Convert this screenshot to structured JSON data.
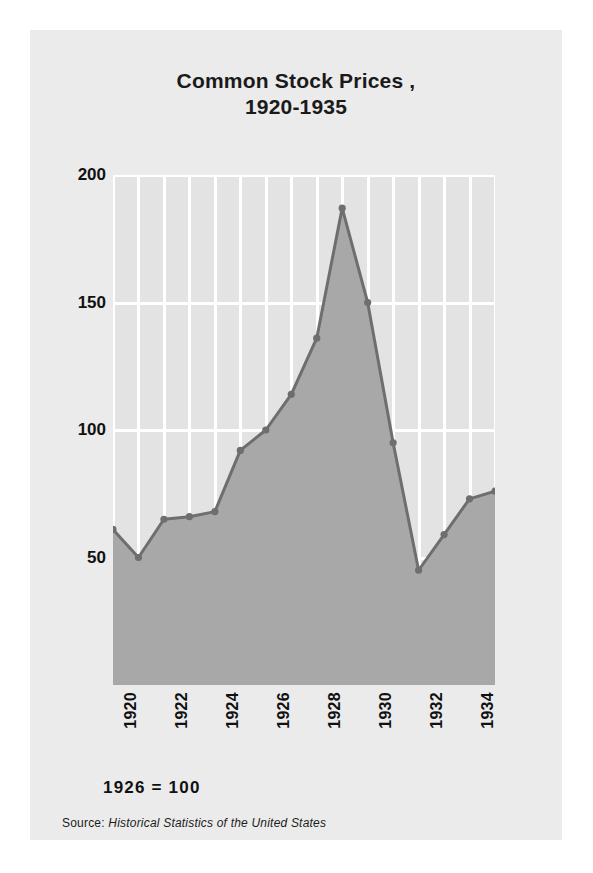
{
  "figure": {
    "title_line1": "Common Stock Prices ,",
    "title_line2": "1920-1935",
    "base_note": "1926 = 100",
    "source_label": "Source:",
    "source_title": "Historical Statistics of the United States"
  },
  "colors": {
    "card_background": "#ebebeb",
    "plot_background": "#e3e3e3",
    "gridline": "#ffffff",
    "area_fill": "#a8a8a8",
    "line": "#6e6e6e",
    "marker": "#6e6e6e",
    "text": "#111111"
  },
  "chart_data": {
    "type": "area",
    "title": "Common Stock Prices , 1920-1935",
    "subtitle": "1926 = 100",
    "xlabel": "",
    "ylabel": "",
    "xlim": [
      1920,
      1935
    ],
    "ylim": [
      0,
      200
    ],
    "yticks": [
      50,
      100,
      150,
      200
    ],
    "ytick_labels": [
      "50",
      "100",
      "150",
      "200"
    ],
    "xticks": [
      1920,
      1922,
      1924,
      1926,
      1928,
      1930,
      1932,
      1934
    ],
    "xtick_labels": [
      "1920",
      "1922",
      "1924",
      "1926",
      "1928",
      "1930",
      "1932",
      "1934"
    ],
    "grid": "vertical-every-year-and-horizontal-at-yticks",
    "legend": "none",
    "markers": true,
    "x": [
      1920,
      1921,
      1922,
      1923,
      1924,
      1925,
      1926,
      1927,
      1928,
      1929,
      1930,
      1931,
      1932,
      1933,
      1934,
      1935
    ],
    "values": [
      61,
      50,
      65,
      66,
      68,
      92,
      100,
      114,
      136,
      187,
      150,
      95,
      45,
      59,
      73,
      76
    ],
    "series": [
      {
        "name": "Common stock price index (1926 = 100)",
        "values": [
          61,
          50,
          65,
          66,
          68,
          92,
          100,
          114,
          136,
          187,
          150,
          95,
          45,
          59,
          73,
          76
        ]
      }
    ],
    "annotations": [
      "Peak in 1929 at about 187",
      "Trough in 1932 at about 45"
    ]
  }
}
